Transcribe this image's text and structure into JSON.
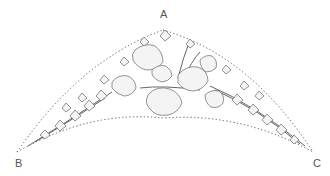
{
  "diagram": {
    "points": [
      {
        "id": "A",
        "label": "A",
        "x": 163,
        "y": 14,
        "position": "apex"
      },
      {
        "id": "B",
        "label": "B",
        "x": 18,
        "y": 163,
        "position": "bottom-left"
      },
      {
        "id": "C",
        "label": "C",
        "x": 317,
        "y": 163,
        "position": "bottom-right"
      }
    ],
    "outline": {
      "style": "dotted",
      "color": "#555555",
      "apex": [
        163,
        30
      ],
      "left_tip": [
        17,
        152
      ],
      "right_tip": [
        313,
        152
      ],
      "bottom_arc_peak": [
        163,
        118
      ]
    },
    "colors": {
      "background": "#ffffff",
      "ink": "#555555",
      "leaf_fill": "#f2f2f2"
    }
  }
}
